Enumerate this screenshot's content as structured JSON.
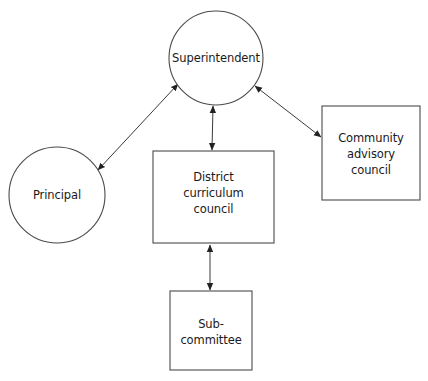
{
  "diagram": {
    "type": "organizational-flow",
    "nodes": {
      "superintendent": {
        "shape": "circle",
        "lines": [
          "Superintendent"
        ]
      },
      "principal": {
        "shape": "circle",
        "lines": [
          "Principal"
        ]
      },
      "district_curriculum_council": {
        "shape": "rectangle",
        "lines": [
          "District",
          "curriculum",
          "council"
        ]
      },
      "community_advisory_council": {
        "shape": "rectangle",
        "lines": [
          "Community",
          "advisory",
          "council"
        ]
      },
      "subcommittee": {
        "shape": "rectangle",
        "lines": [
          "Sub-",
          "committee"
        ]
      }
    },
    "edges": [
      {
        "from": "superintendent",
        "to": "principal",
        "direction": "bidirectional"
      },
      {
        "from": "superintendent",
        "to": "district_curriculum_council",
        "direction": "bidirectional"
      },
      {
        "from": "superintendent",
        "to": "community_advisory_council",
        "direction": "bidirectional"
      },
      {
        "from": "district_curriculum_council",
        "to": "subcommittee",
        "direction": "bidirectional"
      }
    ],
    "colors": {
      "stroke": "#4a4a4a",
      "text": "#1a1a1a",
      "background": "#ffffff"
    }
  }
}
